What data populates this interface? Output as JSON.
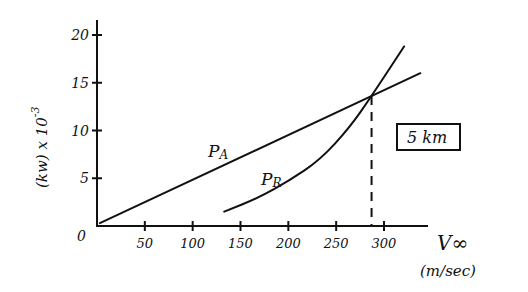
{
  "chart_data": {
    "type": "line",
    "title": "",
    "xlabel": "V∞",
    "xlabel_units": "(m/sec)",
    "ylabel": "(kw) x 10",
    "ylabel_exponent": "-3",
    "xlim": [
      0,
      340
    ],
    "ylim": [
      0,
      21
    ],
    "x_ticks": [
      50,
      100,
      150,
      200,
      250,
      300
    ],
    "y_ticks": [
      5,
      10,
      15,
      20
    ],
    "origin_label": "0",
    "grid": false,
    "annotation_box": "5 km",
    "series": [
      {
        "name": "PA",
        "label": "P_A",
        "points": [
          [
            3,
            0.3
          ],
          [
            338,
            16.0
          ]
        ]
      },
      {
        "name": "PR",
        "label": "P_R",
        "points": [
          [
            133,
            1.5
          ],
          [
            170,
            3.0
          ],
          [
            200,
            4.7
          ],
          [
            233,
            6.9
          ],
          [
            264,
            10.3
          ],
          [
            287,
            13.6
          ],
          [
            321,
            18.8
          ]
        ]
      }
    ],
    "intersection": {
      "x": 287,
      "y": 13.6,
      "dashed_drop_line": true
    }
  }
}
